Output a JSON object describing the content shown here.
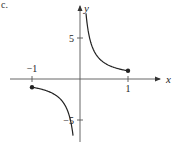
{
  "panel_label": "c.",
  "chart_data": {
    "type": "line",
    "title": "",
    "function": "y = 1/x",
    "domain": [
      -1,
      1
    ],
    "xlabel": "x",
    "ylabel": "y",
    "x_ticks": [
      -1,
      1
    ],
    "x_tick_labels": [
      "−1",
      "1"
    ],
    "y_ticks": [
      5,
      -5
    ],
    "y_tick_labels": [
      "5",
      "−5"
    ],
    "xlim": [
      -1.65,
      1.95
    ],
    "ylim": [
      -7.8,
      9.6
    ],
    "grid": false,
    "legend": null,
    "series": [
      {
        "name": "right branch",
        "x": [
          0.125,
          0.15,
          0.2,
          0.25,
          0.3,
          0.4,
          0.5,
          0.6,
          0.7,
          0.8,
          0.9,
          1.0
        ],
        "y": [
          8,
          6.67,
          5,
          4,
          3.33,
          2.5,
          2,
          1.67,
          1.43,
          1.25,
          1.11,
          1
        ],
        "endpoint": {
          "x": 1,
          "y": 1,
          "closed": true
        }
      },
      {
        "name": "left branch",
        "x": [
          -1.0,
          -0.9,
          -0.8,
          -0.7,
          -0.6,
          -0.5,
          -0.4,
          -0.3,
          -0.25,
          -0.2,
          -0.17,
          -0.145
        ],
        "y": [
          -1,
          -1.11,
          -1.25,
          -1.43,
          -1.67,
          -2,
          -2.5,
          -3.33,
          -4,
          -5,
          -5.88,
          -6.9
        ],
        "endpoint": {
          "x": -1,
          "y": -1,
          "closed": true
        }
      }
    ],
    "pixel_mapping": {
      "origin_px": [
        80,
        79
      ],
      "px_per_x_unit": 48,
      "px_per_y_unit": 8.2
    },
    "colors": {
      "axis": "#444444",
      "curve": "#222222"
    }
  }
}
